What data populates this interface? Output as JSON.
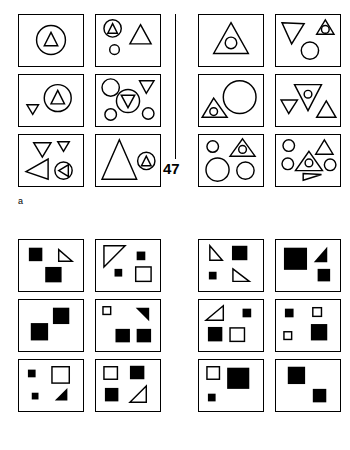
{
  "figure": {
    "panels": [
      {
        "id": "a",
        "label": "a",
        "page_number": "47",
        "shape_vocabulary": [
          "circle",
          "triangle"
        ],
        "style": "outline",
        "rows": 3,
        "columns": 4,
        "cells": [
          {
            "side": "left",
            "row": 0,
            "col": 0,
            "description": "large circle containing a small up-triangle"
          },
          {
            "side": "left",
            "row": 0,
            "col": 1,
            "description": "small circle containing an up-triangle, a large up-triangle, a small circle"
          },
          {
            "side": "left",
            "row": 1,
            "col": 0,
            "description": "small down-triangle, circle containing an up-triangle"
          },
          {
            "side": "left",
            "row": 1,
            "col": 1,
            "description": "circle, down-triangle, circle containing a down-triangle, two small circles"
          },
          {
            "side": "left",
            "row": 2,
            "col": 0,
            "description": "down-triangle, small down-triangle, large left-pointing triangle, circle containing a left-pointing triangle"
          },
          {
            "side": "left",
            "row": 2,
            "col": 1,
            "description": "large up-triangle, circle containing a small up-triangle"
          },
          {
            "side": "right",
            "row": 0,
            "col": 0,
            "description": "large up-triangle containing a circle"
          },
          {
            "side": "right",
            "row": 0,
            "col": 1,
            "description": "large down-triangle, small up-triangle containing a circle, circle"
          },
          {
            "side": "right",
            "row": 1,
            "col": 0,
            "description": "up-triangle containing a small circle, large circle"
          },
          {
            "side": "right",
            "row": 1,
            "col": 1,
            "description": "small down-triangle, down-triangle containing a circle, up-triangle"
          },
          {
            "side": "right",
            "row": 2,
            "col": 0,
            "description": "small circle, up-triangle containing a circle, large circle, medium circle"
          },
          {
            "side": "right",
            "row": 2,
            "col": 1,
            "description": "two circles, small up-triangle, up-triangle containing a circle, circle, small right-pointing triangle"
          }
        ]
      },
      {
        "id": "b",
        "label": "b",
        "page_number": "58",
        "shape_vocabulary": [
          "square",
          "triangle"
        ],
        "style": "filled-and-outline",
        "rows": 3,
        "columns": 4,
        "cells": [
          {
            "side": "left",
            "row": 0,
            "col": 0,
            "description": "filled square, outline triangle, filled square"
          },
          {
            "side": "left",
            "row": 0,
            "col": 1,
            "description": "large outline triangle, small filled square, small filled square, outline square"
          },
          {
            "side": "left",
            "row": 1,
            "col": 0,
            "description": "filled square, filled square"
          },
          {
            "side": "left",
            "row": 1,
            "col": 1,
            "description": "small outline square, filled triangle, two filled squares"
          },
          {
            "side": "left",
            "row": 2,
            "col": 0,
            "description": "small filled square, outline square, small filled square, filled triangle"
          },
          {
            "side": "left",
            "row": 2,
            "col": 1,
            "description": "outline square, filled square, filled square, outline triangle"
          },
          {
            "side": "right",
            "row": 0,
            "col": 0,
            "description": "outline triangle, filled square, small filled square, outline triangle"
          },
          {
            "side": "right",
            "row": 0,
            "col": 1,
            "description": "large filled square, filled triangle, filled square"
          },
          {
            "side": "right",
            "row": 1,
            "col": 0,
            "description": "outline triangle, small filled square, filled square, outline square"
          },
          {
            "side": "right",
            "row": 1,
            "col": 1,
            "description": "small filled square, small outline square, small outline square, filled square"
          },
          {
            "side": "right",
            "row": 2,
            "col": 0,
            "description": "outline square, large filled square, small filled square"
          },
          {
            "side": "right",
            "row": 2,
            "col": 1,
            "description": "filled square, filled square"
          }
        ]
      }
    ],
    "caption": ""
  },
  "colors": {
    "ink": "#000000",
    "background": "#ffffff",
    "caption": "#8a8a8a"
  }
}
